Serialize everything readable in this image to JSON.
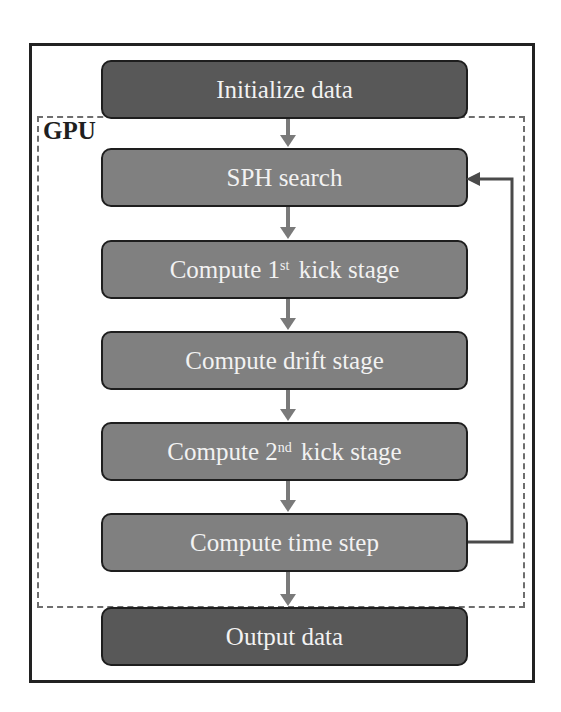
{
  "diagram": {
    "type": "flowchart",
    "region_label": "GPU",
    "steps": [
      {
        "id": "init",
        "label": "Initialize data",
        "sup": "",
        "suffix": "",
        "style": "dark"
      },
      {
        "id": "sph",
        "label": "SPH search",
        "sup": "",
        "suffix": "",
        "style": "mid"
      },
      {
        "id": "kick1",
        "label": "Compute 1",
        "sup": "st",
        "suffix": "kick stage",
        "style": "mid"
      },
      {
        "id": "drift",
        "label": "Compute drift stage",
        "sup": "",
        "suffix": "",
        "style": "mid"
      },
      {
        "id": "kick2",
        "label": "Compute 2",
        "sup": "nd",
        "suffix": "kick stage",
        "style": "mid"
      },
      {
        "id": "timestep",
        "label": "Compute time step",
        "sup": "",
        "suffix": "",
        "style": "mid"
      },
      {
        "id": "output",
        "label": "Output data",
        "sup": "",
        "suffix": "",
        "style": "dark"
      }
    ],
    "edges": [
      {
        "from": "init",
        "to": "sph"
      },
      {
        "from": "sph",
        "to": "kick1"
      },
      {
        "from": "kick1",
        "to": "drift"
      },
      {
        "from": "drift",
        "to": "kick2"
      },
      {
        "from": "kick2",
        "to": "timestep"
      },
      {
        "from": "timestep",
        "to": "output"
      },
      {
        "from": "timestep",
        "to": "sph",
        "kind": "loop-back"
      }
    ],
    "colors": {
      "dark_box": "#585858",
      "mid_box": "#808080",
      "arrow": "#7a7a7a",
      "loop_line": "#4a4a4a",
      "border": "#222222",
      "text": "#f2f2f2"
    }
  }
}
